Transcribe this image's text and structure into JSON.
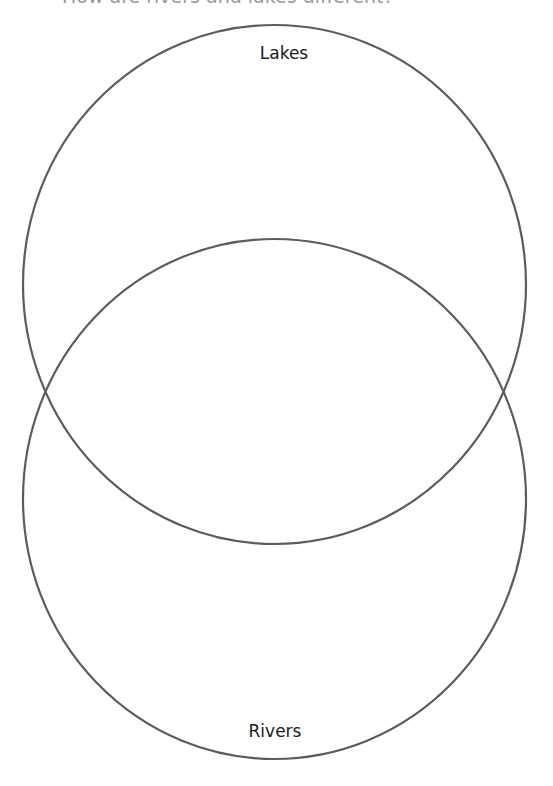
{
  "worksheet": {
    "heading": "How are rivers and lakes different?"
  },
  "venn_diagram": {
    "stroke_color": "#5c5c5c",
    "circles": [
      {
        "id": "top",
        "label": "Lakes",
        "cx": 274.5,
        "cy": 284.5,
        "rx": 251.5,
        "ry": 259.5
      },
      {
        "id": "bottom",
        "label": "Rivers",
        "cx": 274.5,
        "cy": 499,
        "rx": 251.5,
        "ry": 260
      }
    ]
  }
}
